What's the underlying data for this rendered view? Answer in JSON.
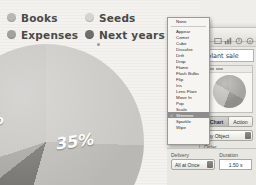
{
  "legend": {
    "rows": [
      [
        {
          "label": "Books",
          "color": "#b9b8b4"
        },
        {
          "label": "Seeds",
          "color": "#d6d5d1"
        }
      ],
      [
        {
          "label": "Expenses",
          "color": "#a3a29d"
        },
        {
          "label": "Next years",
          "color": "#6f6e6a"
        }
      ]
    ]
  },
  "chart_data": {
    "type": "pie",
    "title": "",
    "categories": [
      "Books",
      "Expenses",
      "Seeds",
      "Next years"
    ],
    "values": [
      35,
      7,
      3,
      55
    ],
    "labels": [
      "35%",
      "7%",
      "3%"
    ],
    "colors": [
      "#b9b8b4",
      "#6f6e6a",
      "#a3a29d",
      "#c9c8c4"
    ],
    "legend_position": "top"
  },
  "menu": {
    "items": [
      {
        "label": "None",
        "selected": false
      },
      {
        "separator": true
      },
      {
        "label": "Appear",
        "selected": false
      },
      {
        "label": "Comet",
        "selected": false
      },
      {
        "label": "Cube",
        "selected": false
      },
      {
        "label": "Dissolve",
        "selected": false
      },
      {
        "label": "Drift",
        "selected": false
      },
      {
        "label": "Drop",
        "selected": false
      },
      {
        "label": "Flame",
        "selected": false
      },
      {
        "label": "Flash Bulbs",
        "selected": false
      },
      {
        "label": "Flip",
        "selected": false
      },
      {
        "label": "Iris",
        "selected": false
      },
      {
        "label": "Lens Flare",
        "selected": false
      },
      {
        "label": "Move In",
        "selected": false
      },
      {
        "label": "Pop",
        "selected": false
      },
      {
        "label": "Scale",
        "selected": false
      },
      {
        "label": "Shimmer",
        "selected": true
      },
      {
        "label": "Sparkle",
        "selected": false
      },
      {
        "label": "Wipe",
        "selected": false
      }
    ],
    "check_glyph": "✓"
  },
  "inspector": {
    "title_value": "plant sale",
    "tools": [
      "document-icon",
      "slide-icon",
      "chart-icon",
      "metrics-icon",
      "info-icon"
    ],
    "tabs": [
      {
        "label": "Chart",
        "active": true
      },
      {
        "label": "Action",
        "active": false
      }
    ],
    "build_popup": "by Object",
    "order_label": "Order",
    "order_value": "1"
  },
  "bottom": {
    "delivery_label": "Delivery",
    "delivery_value": "All at Once",
    "duration_label": "Duration",
    "duration_value": "1.50 s"
  }
}
